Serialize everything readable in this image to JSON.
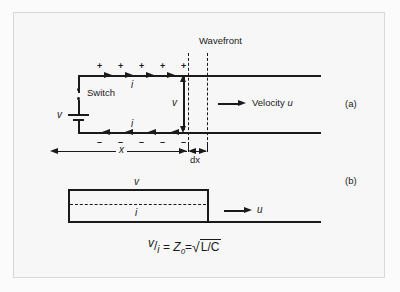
{
  "figure": {
    "background_color": "#f7f7f7",
    "ink_color": "#1a1a1a",
    "panel_a_label": "(a)",
    "panel_b_label": "(b)"
  },
  "panel_a": {
    "wavefront_label": "Wavefront",
    "switch_label": "Switch",
    "source_label": "v",
    "current_top_label": "i",
    "current_bottom_label": "i",
    "voltage_label": "v",
    "velocity_label": "Velocity u",
    "velocity_text": "Velocity",
    "velocity_symbol": "u",
    "distance_label": "x",
    "element_label": "dx",
    "charge_positive": "+",
    "charge_negative": "–",
    "positive_count": 5,
    "negative_count": 5,
    "top_arrow_count": 4,
    "bottom_arrow_count": 4
  },
  "panel_b": {
    "voltage_label": "v",
    "current_label": "i",
    "velocity_symbol": "u"
  },
  "formula": {
    "numerator": "v",
    "slash": "/",
    "denominator": "i",
    "equals": "=",
    "impedance": "Z",
    "impedance_subscript": "0",
    "equals2": "=",
    "radical": "√",
    "radicand": "L/C",
    "full_text": "v/i = Z0 = √(L/C)"
  }
}
